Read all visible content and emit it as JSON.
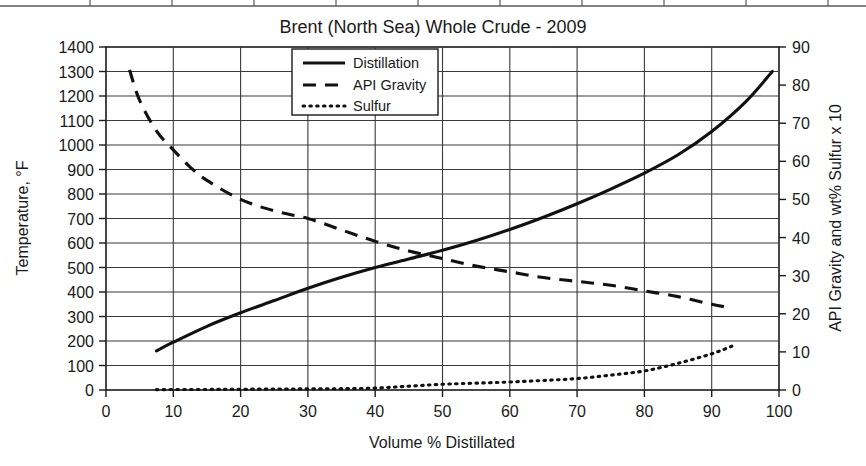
{
  "figure": {
    "title": "Brent (North Sea) Whole Crude - 2009",
    "scan_artifact_label": "partial-axis-line-from-adjacent-figure"
  },
  "chart_data": {
    "type": "line",
    "title": "Brent (North Sea) Whole Crude - 2009",
    "xlabel": "Volume % Distillated",
    "ylabel": "Temperature, °F",
    "ylabel_right": "API Gravity and wt% Sulfur x 10",
    "xlim": [
      0,
      100
    ],
    "ylim": [
      0,
      1400
    ],
    "ylim_right": [
      0,
      90
    ],
    "grid": true,
    "xticks": [
      0,
      10,
      20,
      30,
      40,
      50,
      60,
      70,
      80,
      90,
      100
    ],
    "yticks": [
      0,
      100,
      200,
      300,
      400,
      500,
      600,
      700,
      800,
      900,
      1000,
      1100,
      1200,
      1300,
      1400
    ],
    "yticks_right": [
      0,
      10,
      20,
      30,
      40,
      50,
      60,
      70,
      80,
      90
    ],
    "legend_position": "top-center",
    "series": [
      {
        "name": "Distillation",
        "style": "solid",
        "axis": "left",
        "units": "°F",
        "x": [
          7.5,
          10,
          15,
          20,
          25,
          30,
          35,
          40,
          45,
          50,
          55,
          60,
          65,
          70,
          75,
          80,
          85,
          90,
          95,
          99
        ],
        "values": [
          160,
          195,
          260,
          315,
          365,
          415,
          460,
          500,
          535,
          570,
          610,
          655,
          705,
          760,
          820,
          885,
          960,
          1055,
          1175,
          1300
        ]
      },
      {
        "name": "API Gravity",
        "style": "dashed",
        "axis": "right",
        "units": "°API",
        "x": [
          3.5,
          5,
          7.5,
          10,
          12.5,
          15,
          20,
          25,
          30,
          35,
          40,
          45,
          50,
          55,
          60,
          65,
          70,
          75,
          80,
          85,
          90,
          93
        ],
        "values": [
          84,
          76,
          68,
          63,
          58.5,
          55,
          50,
          47,
          45,
          42,
          39,
          36.5,
          34.5,
          32.5,
          31,
          29.5,
          28.5,
          27.5,
          26,
          24.5,
          22.5,
          21.5
        ]
      },
      {
        "name": "Sulfur",
        "style": "dotted",
        "axis": "right",
        "units": "wt% Sulfur x 10",
        "x": [
          7.5,
          15,
          20,
          25,
          30,
          35,
          40,
          45,
          50,
          55,
          60,
          65,
          70,
          75,
          80,
          85,
          90,
          93
        ],
        "values": [
          0.1,
          0.15,
          0.2,
          0.25,
          0.3,
          0.35,
          0.5,
          1.0,
          1.5,
          1.8,
          2.1,
          2.5,
          3.0,
          3.9,
          5.0,
          7.0,
          9.5,
          11.5
        ]
      }
    ]
  },
  "legend": {
    "items": [
      {
        "label": "Distillation",
        "style": "solid"
      },
      {
        "label": "API Gravity",
        "style": "dashed"
      },
      {
        "label": "Sulfur",
        "style": "dotted"
      }
    ]
  }
}
